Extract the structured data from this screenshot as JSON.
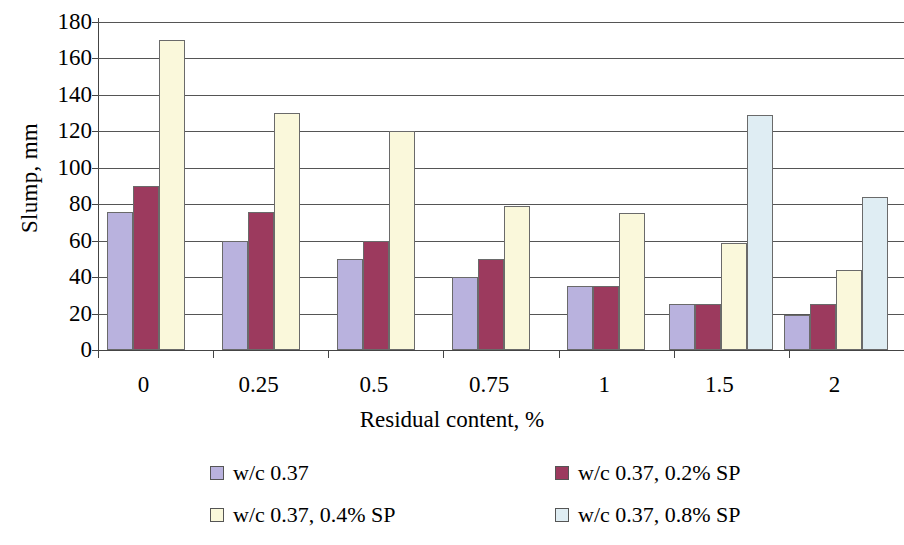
{
  "chart_data": {
    "type": "bar",
    "title": "",
    "xlabel": "Residual content, %",
    "ylabel": "Slump, mm",
    "categories": [
      "0",
      "0.25",
      "0.5",
      "0.75",
      "1",
      "1.5",
      "2"
    ],
    "ylim": [
      0,
      180
    ],
    "ytick_values": [
      0,
      20,
      40,
      60,
      80,
      100,
      120,
      140,
      160,
      180
    ],
    "ytick_labels": [
      "0",
      "20",
      "40",
      "60",
      "80",
      "100",
      "120",
      "140",
      "160",
      "180"
    ],
    "grid": true,
    "legend_position": "bottom",
    "series": [
      {
        "name": "w/c 0.37",
        "color": "#B9B2DE",
        "values": [
          76,
          60,
          50,
          40,
          35,
          25,
          19
        ]
      },
      {
        "name": "w/c 0.37, 0.2% SP",
        "color": "#9C3A5E",
        "values": [
          90,
          76,
          60,
          50,
          35,
          25,
          25
        ]
      },
      {
        "name": "w/c 0.37, 0.4% SP",
        "color": "#FAF8DB",
        "values": [
          170,
          130,
          120,
          79,
          75,
          59,
          44
        ]
      },
      {
        "name": "w/c 0.37, 0.8% SP",
        "color": "#DFEDF3",
        "values": [
          null,
          null,
          null,
          null,
          null,
          129,
          84
        ]
      }
    ]
  },
  "legend": {
    "items": [
      {
        "label": "w/c 0.37",
        "color": "#B9B2DE"
      },
      {
        "label": "w/c 0.37, 0.2% SP",
        "color": "#9C3A5E"
      },
      {
        "label": "w/c 0.37, 0.4% SP",
        "color": "#FAF8DB"
      },
      {
        "label": "w/c 0.37, 0.8% SP",
        "color": "#DFEDF3"
      }
    ]
  },
  "colors": {
    "axis": "#444444",
    "grid": "#555555",
    "bar_border": "#6a6a6a",
    "background": "#ffffff"
  }
}
